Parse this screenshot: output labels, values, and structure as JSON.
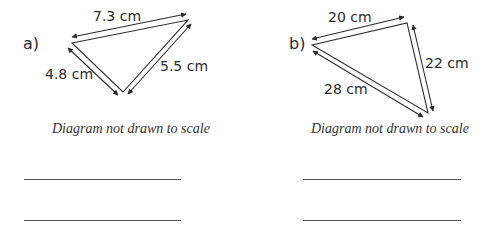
{
  "problems": [
    {
      "label": "a)",
      "sides": {
        "top": "7.3 cm",
        "left": "4.8 cm",
        "right": "5.5 cm"
      },
      "note": "Diagram not drawn to scale",
      "answer_lines": 2
    },
    {
      "label": "b)",
      "sides": {
        "top": "20 cm",
        "right": "22 cm",
        "left": "28 cm"
      },
      "note": "Diagram not drawn to scale",
      "answer_lines": 2
    }
  ],
  "colors": {
    "stroke": "#2b2b2b",
    "text": "#2b2b2b"
  }
}
